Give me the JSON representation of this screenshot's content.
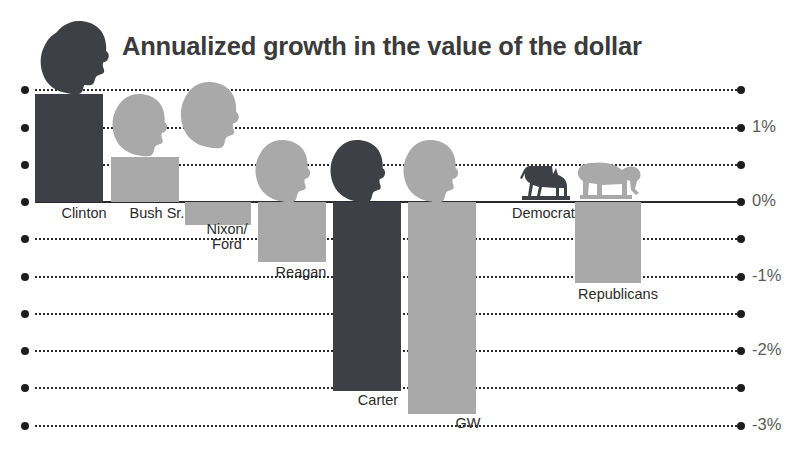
{
  "title": "Annualized growth in the value of the dollar",
  "colors": {
    "democrat": "#3f3f46",
    "republican": "#a9a9a9",
    "grid": "#2a2a2a",
    "axis_text": "#5a5a5a",
    "label_text": "#2b2b2b",
    "title_text": "#3b3b3b",
    "background": "#ffffff"
  },
  "icons": {
    "title_head": "head-silhouette-icon",
    "democrat_symbol": "donkey-icon",
    "republican_symbol": "elephant-icon",
    "bar_head": "president-head-icon"
  },
  "axis": {
    "labels": [
      "1%",
      "0%",
      "-1%",
      "-2%",
      "-3%"
    ],
    "unlabeled_ticks": [
      "1.5%",
      "0.5%",
      "-0.5%",
      "-1.5%",
      "-2.5%"
    ]
  },
  "chart_data": {
    "type": "bar",
    "title": "Annualized growth in the value of the dollar",
    "xlabel": "",
    "ylabel": "",
    "ylim": [
      -3.0,
      1.5
    ],
    "ytick_labels": [
      "1%",
      "0%",
      "-1%",
      "-2%",
      "-3%"
    ],
    "ytick_values": [
      1,
      0,
      -1,
      -2,
      -3
    ],
    "grid": true,
    "legend": "none",
    "categories": [
      "Clinton",
      "Bush Sr.",
      "Nixon/\nFord",
      "Reagan",
      "Carter",
      "GW",
      "Democrats",
      "Republicans"
    ],
    "values": [
      1.45,
      0.61,
      -0.31,
      -0.81,
      -2.54,
      -2.84,
      0.0,
      -1.09
    ],
    "party": [
      "Democrat",
      "Republican",
      "Republican",
      "Republican",
      "Democrat",
      "Republican",
      "Democrat",
      "Republican"
    ]
  },
  "bars": [
    {
      "label": "Clinton",
      "value": 1.45,
      "party": "Democrat",
      "x": 35,
      "w": 68,
      "label_x": 40,
      "label_y": 206,
      "head_x": 38,
      "head_y": 28,
      "head_w": 62,
      "head_h": 68,
      "head_color": "#3f3f46"
    },
    {
      "label": "Bush Sr.",
      "value": 0.61,
      "party": "Republican",
      "x": 111,
      "w": 68,
      "label_x": 113,
      "label_y": 206,
      "head_x": 110,
      "head_y": 92,
      "head_w": 60,
      "head_h": 66,
      "head_color": "#a9a9a9"
    },
    {
      "label": "Nixon/\nFord",
      "value": -0.31,
      "party": "Republican",
      "x": 185,
      "w": 66,
      "label_x": 184,
      "label_y": 222,
      "head_x": 178,
      "head_y": 80,
      "head_w": 64,
      "head_h": 70,
      "head_color": "#a9a9a9"
    },
    {
      "label": "Reagan",
      "value": -0.81,
      "party": "Republican",
      "x": 258,
      "w": 68,
      "label_x": 257,
      "label_y": 265,
      "head_x": 252,
      "head_y": 138,
      "head_w": 62,
      "head_h": 66,
      "head_color": "#a9a9a9"
    },
    {
      "label": "Carter",
      "value": -2.54,
      "party": "Democrat",
      "x": 333,
      "w": 68,
      "label_x": 334,
      "label_y": 393,
      "head_x": 327,
      "head_y": 138,
      "head_w": 62,
      "head_h": 66,
      "head_color": "#3f3f46"
    },
    {
      "label": "GW",
      "value": -2.84,
      "party": "Republican",
      "x": 408,
      "w": 68,
      "label_x": 424,
      "label_y": 416,
      "head_x": 400,
      "head_y": 138,
      "head_w": 62,
      "head_h": 66,
      "head_color": "#a9a9a9"
    },
    {
      "label": "Democrats",
      "value": 0.0,
      "party": "Democrat",
      "x": 512,
      "w": 66,
      "label_x": 504,
      "label_y": 206,
      "head_x": 0,
      "head_y": 0,
      "head_w": 0,
      "head_h": 0,
      "head_color": "#3f3f46"
    },
    {
      "label": "Republicans",
      "value": -1.09,
      "party": "Republican",
      "x": 575,
      "w": 66,
      "label_x": 575,
      "label_y": 287,
      "head_x": 0,
      "head_y": 0,
      "head_w": 0,
      "head_h": 0,
      "head_color": "#a9a9a9"
    }
  ]
}
